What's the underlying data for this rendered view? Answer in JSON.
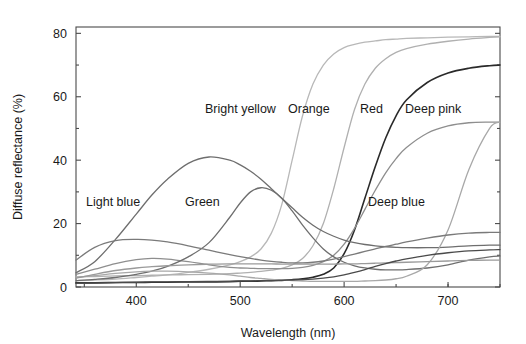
{
  "figure": {
    "background": "#ffffff",
    "plot_area": {
      "left": 76,
      "top": 27,
      "right": 500,
      "bottom": 287
    }
  },
  "chart_data": {
    "type": "line",
    "title": "",
    "xlabel": "Wavelength (nm)",
    "ylabel": "Diffuse reflectance (%)",
    "xlim": [
      342,
      750
    ],
    "ylim": [
      0,
      82
    ],
    "xticks": [
      400,
      500,
      600,
      700
    ],
    "xtick_labels": [
      "400",
      "500",
      "600",
      "700"
    ],
    "xminor_ticks": [
      350,
      450,
      550,
      650,
      700,
      750
    ],
    "yticks": [
      0,
      20,
      40,
      60,
      80
    ],
    "ytick_labels": [
      "0",
      "20",
      "40",
      "60",
      "80"
    ],
    "yminor_ticks": [
      10,
      30,
      50,
      70
    ],
    "grid": false,
    "legend": "inline-annotations",
    "x": [
      342,
      360,
      380,
      400,
      415,
      430,
      450,
      470,
      490,
      500,
      510,
      520,
      530,
      540,
      550,
      560,
      570,
      580,
      590,
      600,
      610,
      620,
      630,
      640,
      650,
      660,
      680,
      700,
      720,
      740,
      750
    ],
    "series": [
      {
        "name": "Bright yellow",
        "label": "Bright yellow",
        "color": "#b8b8b8",
        "width": 1.3,
        "label_x": 205,
        "label_y": 113,
        "values": [
          2.0,
          2.2,
          2.5,
          3.0,
          3.4,
          3.8,
          4.6,
          5.6,
          7.0,
          8.0,
          9.5,
          12.0,
          17.0,
          26.0,
          40.0,
          54.0,
          64.0,
          70.0,
          73.5,
          75.5,
          76.5,
          77.2,
          77.6,
          78.0,
          78.2,
          78.4,
          78.6,
          78.8,
          78.9,
          79.0,
          79.0
        ]
      },
      {
        "name": "Orange",
        "label": "Orange",
        "color": "#b0b0b0",
        "width": 1.3,
        "label_x": 288,
        "label_y": 113,
        "values": [
          3.2,
          3.3,
          3.5,
          3.6,
          3.7,
          3.8,
          3.9,
          4.0,
          4.2,
          4.4,
          4.6,
          4.9,
          5.3,
          5.9,
          7.0,
          9.0,
          13.0,
          20.0,
          31.0,
          44.0,
          56.0,
          64.0,
          69.0,
          72.0,
          74.0,
          75.2,
          76.6,
          77.5,
          78.2,
          78.7,
          78.9
        ]
      },
      {
        "name": "Red",
        "label": "Red",
        "color": "#2a2a2a",
        "width": 1.6,
        "label_x": 360,
        "label_y": 113,
        "values": [
          1.3,
          1.3,
          1.4,
          1.4,
          1.5,
          1.5,
          1.6,
          1.6,
          1.7,
          1.8,
          1.8,
          1.9,
          2.0,
          2.1,
          2.3,
          2.6,
          3.1,
          4.0,
          6.0,
          10.5,
          18.0,
          28.0,
          38.0,
          47.0,
          54.0,
          59.0,
          64.5,
          67.5,
          69.0,
          69.8,
          70.0
        ]
      },
      {
        "name": "Deep pink",
        "label": "Deep pink",
        "color": "#8e8e8e",
        "width": 1.3,
        "label_x": 405,
        "label_y": 113,
        "values": [
          4.0,
          5.6,
          7.4,
          8.6,
          9.0,
          8.8,
          8.0,
          7.0,
          6.2,
          6.0,
          5.9,
          5.8,
          5.8,
          5.8,
          5.9,
          6.2,
          6.8,
          8.0,
          10.0,
          13.5,
          18.5,
          24.5,
          30.5,
          36.0,
          40.5,
          44.0,
          48.5,
          50.8,
          51.8,
          52.0,
          52.0
        ]
      },
      {
        "name": "Light blue",
        "label": "Light blue",
        "color": "#6e6e6e",
        "width": 1.3,
        "label_x": 86,
        "label_y": 206,
        "values": [
          4.5,
          8.0,
          15.0,
          23.0,
          29.0,
          34.0,
          39.0,
          41.0,
          40.0,
          38.5,
          36.5,
          34.0,
          31.0,
          28.0,
          25.0,
          22.0,
          19.5,
          17.5,
          16.0,
          14.8,
          14.0,
          13.4,
          13.0,
          12.7,
          12.5,
          12.4,
          12.4,
          12.6,
          13.0,
          13.2,
          13.2
        ]
      },
      {
        "name": "Green",
        "label": "Green",
        "color": "#6e6e6e",
        "width": 1.3,
        "label_x": 185,
        "label_y": 206,
        "values": [
          2.0,
          2.4,
          3.0,
          4.0,
          5.0,
          6.5,
          9.5,
          14.0,
          22.0,
          26.5,
          30.0,
          31.3,
          30.5,
          28.0,
          24.0,
          19.5,
          15.5,
          12.0,
          9.5,
          7.8,
          6.7,
          6.0,
          5.6,
          5.4,
          5.4,
          5.5,
          6.0,
          7.0,
          8.5,
          9.5,
          9.8
        ]
      },
      {
        "name": "Deep blue",
        "label": "Deep blue",
        "color": "#a8a8a8",
        "width": 1.3,
        "label_x": 368,
        "label_y": 206,
        "values": [
          3.0,
          3.6,
          4.3,
          4.8,
          5.0,
          5.0,
          4.8,
          4.4,
          3.8,
          3.4,
          3.0,
          2.7,
          2.4,
          2.2,
          2.0,
          1.9,
          1.8,
          1.8,
          1.8,
          1.8,
          1.8,
          1.9,
          2.0,
          2.2,
          2.6,
          3.4,
          7.0,
          18.0,
          37.0,
          50.0,
          52.0
        ]
      },
      {
        "name": "Blue hump",
        "label": "",
        "color": "#7a7a7a",
        "width": 1.3,
        "label_x": 0,
        "label_y": 0,
        "values": [
          8.5,
          12.5,
          14.6,
          15.0,
          14.8,
          14.2,
          13.0,
          11.6,
          10.2,
          9.6,
          9.0,
          8.5,
          8.1,
          7.8,
          7.6,
          7.6,
          7.8,
          8.2,
          8.8,
          9.6,
          10.4,
          11.2,
          12.0,
          12.8,
          13.5,
          14.2,
          15.4,
          16.4,
          17.0,
          17.2,
          17.2
        ]
      },
      {
        "name": "Low grey",
        "label": "",
        "color": "#9a9a9a",
        "width": 1.3,
        "label_x": 0,
        "label_y": 0,
        "values": [
          2.8,
          4.0,
          5.2,
          6.0,
          6.4,
          6.7,
          7.0,
          7.2,
          7.3,
          7.3,
          7.3,
          7.3,
          7.3,
          7.2,
          7.2,
          7.2,
          7.2,
          7.2,
          7.2,
          7.3,
          7.3,
          7.4,
          7.5,
          7.6,
          7.7,
          7.8,
          8.0,
          8.2,
          8.4,
          8.5,
          8.5
        ]
      },
      {
        "name": "Dark baseline",
        "label": "",
        "color": "#4a4a4a",
        "width": 1.3,
        "label_x": 0,
        "label_y": 0,
        "values": [
          1.2,
          1.3,
          1.4,
          1.5,
          1.6,
          1.6,
          1.7,
          1.8,
          1.8,
          1.9,
          1.9,
          2.0,
          2.0,
          2.1,
          2.2,
          2.3,
          2.5,
          2.8,
          3.2,
          3.8,
          4.6,
          5.5,
          6.5,
          7.4,
          8.2,
          8.9,
          10.0,
          10.8,
          11.4,
          11.7,
          11.8
        ]
      }
    ]
  }
}
